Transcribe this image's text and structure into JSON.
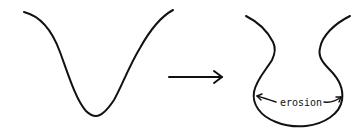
{
  "diagram": {
    "before_shape": {
      "name": "V-shaped valley"
    },
    "transition_arrow": {
      "direction": "right"
    },
    "after_shape": {
      "name": "eroded valley",
      "annotation": {
        "label": "erosion",
        "arrows": [
          "left",
          "right"
        ]
      }
    },
    "colors": {
      "stroke": "#111111",
      "background": "#ffffff"
    }
  }
}
